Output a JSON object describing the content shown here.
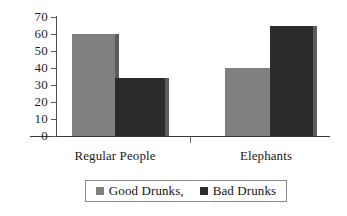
{
  "chart_data": {
    "type": "bar",
    "title": "",
    "subtitle": "",
    "xlabel": "",
    "ylabel": "",
    "categories": [
      "Regular People",
      "Elephants"
    ],
    "series": [
      {
        "name": "Good Drunks,",
        "values": [
          60,
          40
        ],
        "color": "#808080"
      },
      {
        "name": "Bad Drunks",
        "values": [
          34,
          65
        ],
        "color": "#2b2b2b"
      }
    ],
    "ylim": [
      0,
      70
    ],
    "ytick_values": [
      70,
      60,
      50,
      40,
      30,
      20,
      10,
      0
    ],
    "ytick_labels": [
      "70",
      "60",
      "50",
      "40",
      "30",
      "20",
      "10",
      "0"
    ],
    "grid": false,
    "legend_position": "bottom",
    "bar_style": "grouped-adjacent-with-shadow"
  },
  "legend": {
    "entries": [
      {
        "label": "Good Drunks,",
        "color": "#808080"
      },
      {
        "label": "Bad Drunks",
        "color": "#2b2b2b"
      }
    ]
  },
  "axis": {
    "y_labels": [
      "70",
      "60",
      "50",
      "40",
      "30",
      "20",
      "10",
      "0"
    ],
    "x_labels": [
      "Regular People",
      "Elephants"
    ]
  },
  "colors": {
    "series_good": "#808080",
    "series_bad": "#2b2b2b",
    "shadow": "#5c5c5c",
    "axis": "#3a3a3a",
    "text": "#1a1a1a",
    "background": "#ffffff",
    "legend_border": "#8a8a8a"
  }
}
